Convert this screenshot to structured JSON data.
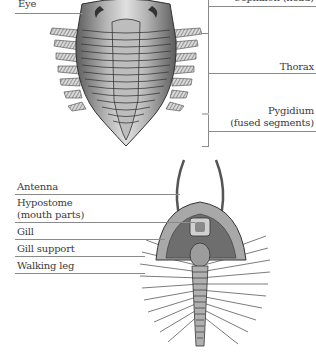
{
  "diagram": {
    "top_view": {
      "labels": {
        "eye": "Eye",
        "cephalon": "Cephalon (head)",
        "thorax": "Thorax",
        "pygidium": "Pygidium",
        "pygidium_note": "(fused segments)"
      }
    },
    "bottom_view": {
      "labels": {
        "antenna": "Antenna",
        "hypostome": "Hypostome",
        "hypostome_note": "(mouth parts)",
        "gill": "Gill",
        "gill_support": "Gill support",
        "walking_leg": "Walking leg"
      }
    },
    "colors": {
      "text": "#3a3a3a",
      "leader_line": "#8a8a8a",
      "shell_dark": "#5a5a5a",
      "shell_mid": "#9a9a9a",
      "shell_light": "#cfcfcf"
    }
  }
}
